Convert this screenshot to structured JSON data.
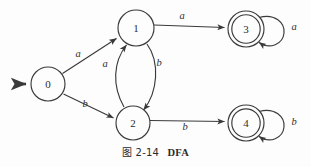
{
  "figure": {
    "caption_figno": "图 2-14",
    "caption_sep": "   ",
    "caption_title": "DFA",
    "kind": "state-transition-diagram",
    "ink_color": "#3a3a3a",
    "background_color": "#fdfdfd"
  },
  "automaton": {
    "start_marker": "⇒",
    "alphabet": [
      "a",
      "b"
    ],
    "states": [
      {
        "id": "s0",
        "label": "0",
        "accepting": false,
        "start": true,
        "cx": 48,
        "cy": 84,
        "r": 17
      },
      {
        "id": "s1",
        "label": "1",
        "accepting": false,
        "start": false,
        "cx": 136,
        "cy": 28,
        "r": 18
      },
      {
        "id": "s2",
        "label": "2",
        "accepting": false,
        "start": false,
        "cx": 133,
        "cy": 123,
        "r": 17
      },
      {
        "id": "s3",
        "label": "3",
        "accepting": true,
        "start": false,
        "cx": 246,
        "cy": 29,
        "r": 18
      },
      {
        "id": "s4",
        "label": "4",
        "accepting": true,
        "start": false,
        "cx": 246,
        "cy": 123,
        "r": 18
      }
    ],
    "transitions": [
      {
        "from": "0",
        "to": "1",
        "symbol": "a",
        "shape": "straight",
        "label_x": 78,
        "label_y": 55
      },
      {
        "from": "0",
        "to": "2",
        "symbol": "b",
        "shape": "straight",
        "label_x": 85,
        "label_y": 105
      },
      {
        "from": "1",
        "to": "3",
        "symbol": "a",
        "shape": "straight",
        "label_x": 182,
        "label_y": 17
      },
      {
        "from": "2",
        "to": "1",
        "symbol": "a",
        "shape": "curve",
        "label_x": 105,
        "label_y": 65
      },
      {
        "from": "1",
        "to": "2",
        "symbol": "b",
        "shape": "curve",
        "label_x": 159,
        "label_y": 64
      },
      {
        "from": "2",
        "to": "4",
        "symbol": "b",
        "shape": "straight",
        "label_x": 185,
        "label_y": 128
      },
      {
        "from": "3",
        "to": "3",
        "symbol": "a",
        "shape": "self-loop",
        "label_x": 292,
        "label_y": 28
      },
      {
        "from": "4",
        "to": "4",
        "symbol": "b",
        "shape": "self-loop",
        "label_x": 292,
        "label_y": 123
      }
    ]
  }
}
